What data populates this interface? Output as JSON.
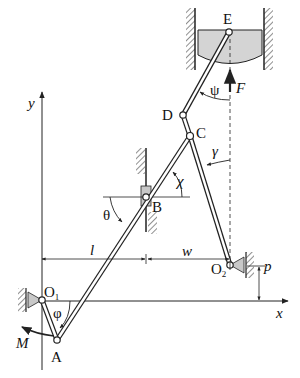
{
  "diagram": {
    "title": "",
    "points": {
      "E": "E",
      "D": "D",
      "C": "C",
      "B": "B",
      "O1": "O",
      "O1_sub": "1",
      "O2": "O",
      "O2_sub": "2",
      "A": "A"
    },
    "angles": {
      "psi": "ψ",
      "gamma": "γ",
      "chi": "χ",
      "theta": "θ",
      "phi": "φ"
    },
    "forces": {
      "F": "F",
      "M": "M"
    },
    "dimensions": {
      "l": "l",
      "w": "w",
      "p": "p"
    },
    "axes": {
      "x": "x",
      "y": "y"
    },
    "colors": {
      "line": "#222222",
      "fill_gray": "#c8c8c8",
      "block_fill": "#d4d4d4"
    }
  }
}
